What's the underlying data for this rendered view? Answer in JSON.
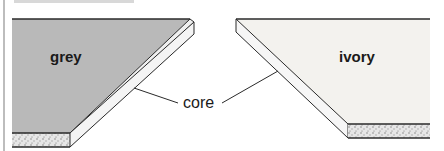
{
  "diagram": {
    "title_clipped": "",
    "boards": [
      {
        "label": "grey",
        "face_color": "#b9b9b9"
      },
      {
        "label": "ivory",
        "face_color": "#f3f2ee"
      }
    ],
    "callout": {
      "label": "core"
    },
    "colors": {
      "edge": "#2a2a2a",
      "core": "#e8e8e8",
      "background": "#ffffff"
    }
  }
}
